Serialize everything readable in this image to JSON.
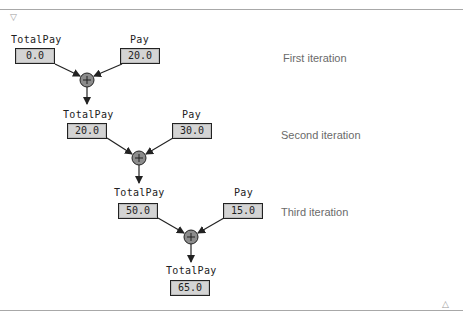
{
  "decorations": {
    "top_marker_icon": "▽",
    "bottom_marker_icon": "△"
  },
  "iterations": [
    {
      "label": "First iteration",
      "left": {
        "name": "TotalPay",
        "value": "0.0"
      },
      "right": {
        "name": "Pay",
        "value": "20.0"
      },
      "operator": "+"
    },
    {
      "label": "Second iteration",
      "left": {
        "name": "TotalPay",
        "value": "20.0"
      },
      "right": {
        "name": "Pay",
        "value": "30.0"
      },
      "operator": "+"
    },
    {
      "label": "Third iteration",
      "left": {
        "name": "TotalPay",
        "value": "50.0"
      },
      "right": {
        "name": "Pay",
        "value": "15.0"
      },
      "operator": "+"
    }
  ],
  "result": {
    "name": "TotalPay",
    "value": "65.0"
  },
  "colors": {
    "box_fill": "#d4d4d4",
    "operator_fill": "#8c8c8c",
    "stroke": "#222222",
    "caption": "#6a6a6a",
    "rule": "#a8a8a8"
  }
}
